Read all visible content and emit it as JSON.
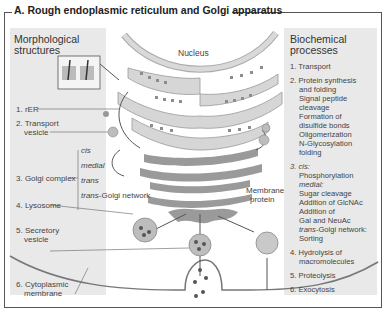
{
  "title": "A. Rough endoplasmic reticulum and Golgi apparatus",
  "left_panel": {
    "heading_line1": "Morphological",
    "heading_line2": "structures",
    "items": [
      {
        "line1": "1. rER",
        "line2": ""
      },
      {
        "line1": "2. Transport",
        "line2": "vesicle"
      },
      {
        "line1": "3. Golgi complex",
        "line2": ""
      },
      {
        "line1": "4. Lysosome",
        "line2": ""
      },
      {
        "line1": "5. Secretory",
        "line2": "vesicle"
      },
      {
        "line1": "6. Cytoplasmic",
        "line2": "membrane"
      }
    ],
    "golgi_subparts": [
      "cis",
      "medial",
      "trans"
    ],
    "trans_golgi_prefix": "trans",
    "trans_golgi_suffix": "-Golgi network"
  },
  "center": {
    "nucleus_label": "Nucleus",
    "membrane_protein_line1": "Membrane",
    "membrane_protein_line2": "protein"
  },
  "right_panel": {
    "heading_line1": "Biochemical",
    "heading_line2": "processes",
    "p1": "1. Transport",
    "p2": [
      "2. Protein synthesis",
      "and folding",
      "Signal peptide",
      "cleavage",
      "Formation of",
      "disulfide bonds",
      "Oligomerization",
      "N-Glycosylation",
      "folding"
    ],
    "p3_cis": "3. cis:",
    "p3_cis_text": "Phosphorylation",
    "p3_medial": "medial:",
    "p3_medial_text": [
      "Sugar cleavage",
      "Addition of GlcNAc",
      "Addition of",
      "Gal and NeuAc"
    ],
    "p3_trans_prefix": "trans",
    "p3_trans_suffix": "-Golgi network:",
    "p3_trans_text": "Sorting",
    "p4": [
      "4. Hydrolysis of",
      "macromolecules"
    ],
    "p5": "5. Proteolysis",
    "p6": "6. Exocytosis"
  },
  "colors": {
    "panel_bg": "#e9e9e9",
    "er_fill": "#d6d6d6",
    "golgi_fill": "#9a9a9a",
    "ribosome": "#8c8c8c",
    "vesicle_fill": "#bdbdbd",
    "line": "#666666"
  }
}
